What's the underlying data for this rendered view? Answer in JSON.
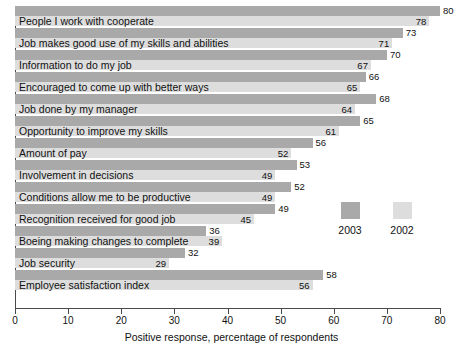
{
  "chart_data": {
    "type": "bar",
    "orientation": "horizontal",
    "title": "",
    "xlabel": "Positive response, percentage of respondents",
    "ylabel": "",
    "xlim": [
      0,
      80
    ],
    "xticks": [
      0,
      10,
      20,
      30,
      40,
      50,
      60,
      70,
      80
    ],
    "grid": false,
    "legend_position": "inside-right",
    "categories": [
      "People I work with cooperate",
      "Job makes good use of my skills and abilities",
      "Information to do my job",
      "Encouraged to come up with better ways",
      "Job done by my manager",
      "Opportunity to improve my skills",
      "Amount of pay",
      "Involvement in decisions",
      "Conditions allow me to be productive",
      "Recognition received for good job",
      "Boeing making changes to complete",
      "Job security",
      "Employee satisfaction index"
    ],
    "series": [
      {
        "name": "2003",
        "color": "#a9a9a9",
        "values": [
          80,
          73,
          70,
          66,
          68,
          65,
          56,
          53,
          52,
          49,
          36,
          32,
          58
        ]
      },
      {
        "name": "2002",
        "color": "#dddddd",
        "values": [
          78,
          71,
          67,
          65,
          64,
          61,
          52,
          49,
          49,
          45,
          39,
          29,
          56
        ]
      }
    ]
  },
  "legend": {
    "items": [
      {
        "label": "2003",
        "color": "#a9a9a9"
      },
      {
        "label": "2002",
        "color": "#dddddd"
      }
    ]
  },
  "axis": {
    "tick_labels": [
      "0",
      "10",
      "20",
      "30",
      "40",
      "50",
      "60",
      "70",
      "80"
    ],
    "title": "Positive response, percentage of respondents"
  }
}
